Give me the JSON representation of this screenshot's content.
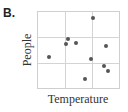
{
  "panel_label": "B.",
  "chart_data": {
    "type": "scatter",
    "title": "",
    "xlabel": "Temperature",
    "ylabel": "People",
    "xlim": [
      0,
      1
    ],
    "ylim": [
      0,
      1
    ],
    "grid": true,
    "grid_divisions": 3,
    "tick_labels": false,
    "legend": null,
    "marker_color": "#555555",
    "points": [
      {
        "x": 0.68,
        "y": 0.92
      },
      {
        "x": 0.37,
        "y": 0.64
      },
      {
        "x": 0.34,
        "y": 0.58
      },
      {
        "x": 0.47,
        "y": 0.59
      },
      {
        "x": 0.84,
        "y": 0.55
      },
      {
        "x": 0.13,
        "y": 0.41
      },
      {
        "x": 0.65,
        "y": 0.38
      },
      {
        "x": 0.81,
        "y": 0.29
      },
      {
        "x": 0.86,
        "y": 0.22
      },
      {
        "x": 0.58,
        "y": 0.12
      }
    ]
  }
}
